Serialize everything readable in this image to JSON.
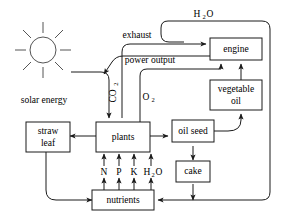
{
  "diagram": {
    "boxes": [
      {
        "id": "engine",
        "label": "engine",
        "label2": "",
        "x": 210,
        "y": 38,
        "w": 52,
        "h": 22
      },
      {
        "id": "vegetable-oil",
        "label": "vegetable",
        "label2": "oil",
        "x": 210,
        "y": 80,
        "w": 52,
        "h": 30
      },
      {
        "id": "straw-leaf",
        "label": "straw",
        "label2": "leaf",
        "x": 26,
        "y": 122,
        "w": 40,
        "h": 30
      },
      {
        "id": "plants",
        "label": "plants",
        "label2": "",
        "x": 96,
        "y": 122,
        "w": 54,
        "h": 30
      },
      {
        "id": "oil-seed",
        "label": "oil seed",
        "label2": "",
        "x": 172,
        "y": 124,
        "w": 42,
        "h": 22
      },
      {
        "id": "cake",
        "label": "cake",
        "label2": "",
        "x": 176,
        "y": 164,
        "w": 34,
        "h": 20
      },
      {
        "id": "nutrients",
        "label": "nutrients",
        "label2": "",
        "x": 96,
        "y": 190,
        "w": 56,
        "h": 20
      }
    ],
    "labels": [
      {
        "id": "h2o-top",
        "text": "H",
        "sub": "2",
        "text2": "O",
        "x": 200,
        "y": 14
      },
      {
        "id": "exhaust",
        "text": "exhaust",
        "x": 135,
        "y": 35
      },
      {
        "id": "power-output",
        "text": "power output",
        "x": 147,
        "y": 60
      },
      {
        "id": "co2",
        "text": "CO",
        "sub": "2",
        "x": 117,
        "y": 92
      },
      {
        "id": "o2",
        "text": "O",
        "sub": "2",
        "x": 146,
        "y": 97
      },
      {
        "id": "solar-energy",
        "text": "solar energy",
        "x": 44,
        "y": 100
      },
      {
        "id": "nitrogen",
        "text": "N",
        "x": 104,
        "y": 172
      },
      {
        "id": "phosphorus",
        "text": "P",
        "x": 119,
        "y": 172
      },
      {
        "id": "potassium",
        "text": "K",
        "x": 134,
        "y": 172
      },
      {
        "id": "water",
        "text": "H",
        "sub": "2",
        "text2": "O",
        "x": 150,
        "y": 172
      }
    ],
    "sun": {
      "cx": 43,
      "cy": 50,
      "r": 13,
      "rays": 8,
      "ray_inner": 17,
      "ray_outer": 28
    },
    "colors": {
      "stroke": "#1a1a1a",
      "sun": "#555555",
      "background": "#ffffff"
    },
    "flows": [
      {
        "from": "solar",
        "to": "plants",
        "label": "solar energy"
      },
      {
        "from": "atmosphere",
        "to": "plants",
        "label": "CO2"
      },
      {
        "from": "plants",
        "to": "engine",
        "label": "O2"
      },
      {
        "from": "engine",
        "to": "plants",
        "label": "exhaust"
      },
      {
        "from": "engine",
        "to": "external",
        "label": "power output"
      },
      {
        "from": "engine",
        "to": "nutrients",
        "label": "H2O"
      },
      {
        "from": "vegetable-oil",
        "to": "engine",
        "label": ""
      },
      {
        "from": "oil-seed",
        "to": "vegetable-oil",
        "label": ""
      },
      {
        "from": "plants",
        "to": "oil-seed",
        "label": ""
      },
      {
        "from": "plants",
        "to": "straw-leaf",
        "label": ""
      },
      {
        "from": "oil-seed",
        "to": "cake",
        "label": ""
      },
      {
        "from": "cake",
        "to": "nutrients",
        "label": ""
      },
      {
        "from": "straw-leaf",
        "to": "nutrients",
        "label": ""
      },
      {
        "from": "nutrients",
        "to": "plants",
        "label": "N P K H2O"
      }
    ]
  }
}
